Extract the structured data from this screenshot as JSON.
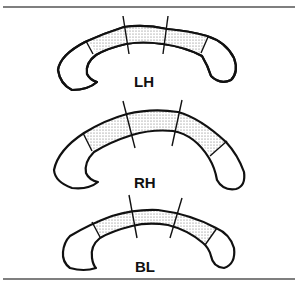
{
  "figure": {
    "panels": [
      {
        "label": "LH"
      },
      {
        "label": "RH"
      },
      {
        "label": "BL"
      }
    ],
    "colors": {
      "line": "#111111",
      "rule": "#555555",
      "background": "#ffffff"
    }
  }
}
